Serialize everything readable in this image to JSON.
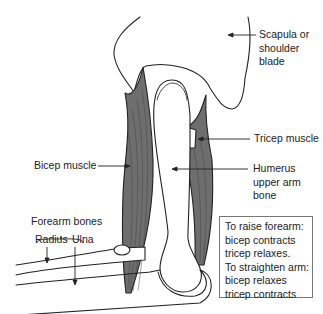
{
  "diagram": {
    "type": "anatomy-arm-elbow",
    "labels": {
      "scapula": [
        "Scapula or",
        "shoulder",
        "blade"
      ],
      "tricep": "Tricep muscle",
      "bicep": "Bicep muscle",
      "humerus": [
        "Humerus",
        "upper arm",
        "bone"
      ],
      "forearm_bones": "Forearm bones",
      "radius": "Radius",
      "ulna": "Ulna"
    },
    "info_box": {
      "lines": [
        "To raise forearm:",
        "bicep contracts",
        "tricep relaxes.",
        "To straighten arm:",
        "bicep relaxes",
        "tricep contracts"
      ]
    },
    "colors": {
      "muscle": "#6e6e6e",
      "outline": "#222222",
      "bone": "#ffffff"
    }
  }
}
